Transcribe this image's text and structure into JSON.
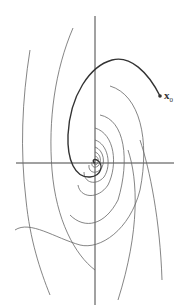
{
  "diagram": {
    "type": "phase-portrait",
    "initial_point_label": "x",
    "initial_point_subscript": "0",
    "colors": {
      "axis": "#444444",
      "trajectory": "#555555",
      "highlight": "#333333",
      "background": "#ffffff"
    }
  }
}
